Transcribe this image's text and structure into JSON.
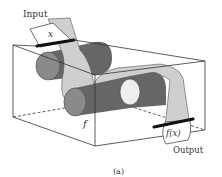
{
  "figure": {
    "input_label": "Input",
    "input_symbol": "x",
    "function_symbol": "f",
    "output_symbol": "f(x)",
    "output_label": "Output",
    "caption": "(a)"
  },
  "colors": {
    "background": "#ffffff",
    "box_line": "#333333",
    "roller_dark": "#666666",
    "roller_end": "#8a8a8a",
    "roller_light_end": "#eeeeee",
    "strip": "#c9c9c9",
    "slot": "#111111"
  }
}
